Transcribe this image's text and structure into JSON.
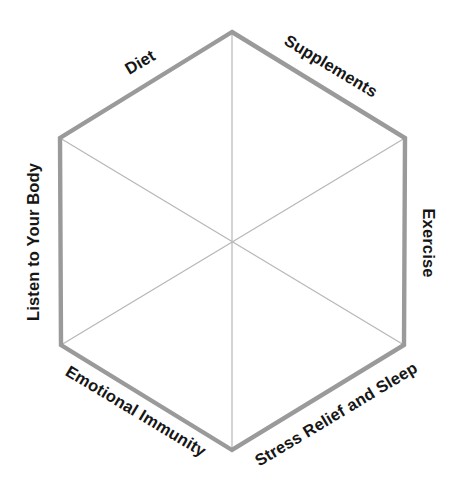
{
  "diagram": {
    "type": "hexagon-framework",
    "title": "",
    "background_color": "#ffffff",
    "outline_color": "#9a9a9a",
    "spoke_color": "#b7b7b7",
    "label_color": "#161616",
    "outline_width_px": 4,
    "spoke_width_px": 1,
    "center": {
      "x": 233,
      "y": 242
    },
    "vertices": [
      {
        "name": "top",
        "x": 232,
        "y": 32
      },
      {
        "name": "upper-right",
        "x": 405,
        "y": 138
      },
      {
        "name": "lower-right",
        "x": 404,
        "y": 345
      },
      {
        "name": "bottom",
        "x": 232,
        "y": 450
      },
      {
        "name": "lower-left",
        "x": 61,
        "y": 345
      },
      {
        "name": "upper-left",
        "x": 60,
        "y": 138
      }
    ],
    "segments": [
      {
        "id": "diet",
        "label": "Diet",
        "edge": "upper-left",
        "rotation_deg": -31
      },
      {
        "id": "supplements",
        "label": "Supplements",
        "edge": "upper-right",
        "rotation_deg": 31
      },
      {
        "id": "exercise",
        "label": "Exercise",
        "edge": "right",
        "rotation_deg": 90
      },
      {
        "id": "stress-relief-and-sleep",
        "label": "Stress Relief and Sleep",
        "edge": "lower-right",
        "rotation_deg": -31
      },
      {
        "id": "emotional-immunity",
        "label": "Emotional Immunity",
        "edge": "lower-left",
        "rotation_deg": 31
      },
      {
        "id": "listen-to-your-body",
        "label": "Listen to Your Body",
        "edge": "left",
        "rotation_deg": -90
      }
    ]
  }
}
